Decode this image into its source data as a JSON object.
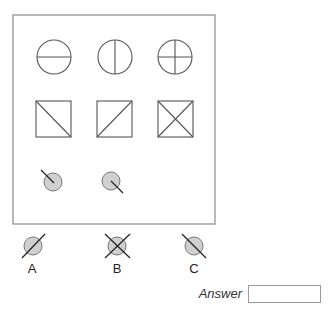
{
  "question": {
    "cropped_heading": "",
    "puzzle_grid": {
      "rows": [
        {
          "shape": "circle",
          "items": [
            "circle-horizontal-line",
            "circle-vertical-line",
            "circle-cross"
          ]
        },
        {
          "shape": "square",
          "items": [
            "square-diagonal-backslash",
            "square-diagonal-slash",
            "square-x"
          ]
        },
        {
          "shape": "small-shaded-circle",
          "items": [
            "line-upper-left-outside",
            "line-lower-right-outside",
            "missing"
          ]
        }
      ]
    },
    "options": [
      {
        "label": "A",
        "figure": "shaded-circle-slash-through"
      },
      {
        "label": "B",
        "figure": "shaded-circle-x-through"
      },
      {
        "label": "C",
        "figure": "shaded-circle-backslash-through"
      }
    ],
    "answer": {
      "label": "Answer",
      "value": ""
    }
  },
  "colors": {
    "stroke": "#555555",
    "fill": "#d0d0d0",
    "frame": "#8a8a8a"
  }
}
